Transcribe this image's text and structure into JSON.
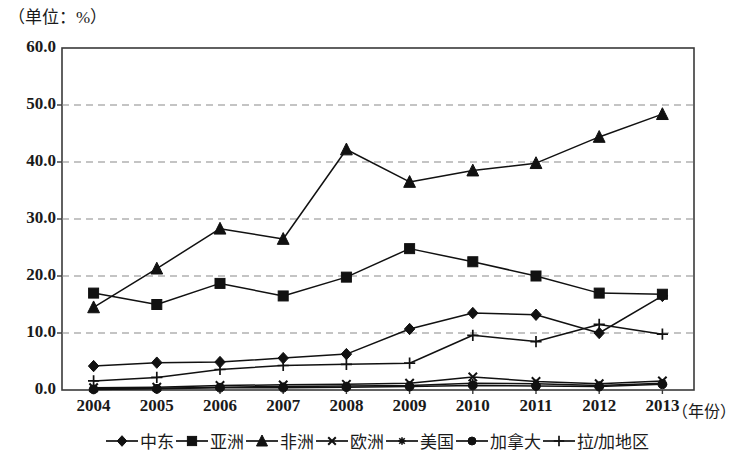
{
  "chart_data": {
    "type": "line",
    "title": "（单位：%）",
    "xlabel": "（年份）",
    "ylabel": "",
    "categories": [
      "2004",
      "2005",
      "2006",
      "2007",
      "2008",
      "2009",
      "2010",
      "2011",
      "2012",
      "2013"
    ],
    "ylim": [
      0,
      60
    ],
    "yticks": [
      "0.0",
      "10.0",
      "20.0",
      "30.0",
      "40.0",
      "50.0",
      "60.0"
    ],
    "grid": true,
    "legend_position": "bottom",
    "series": [
      {
        "name": "中东",
        "marker": "diamond",
        "values": [
          4.2,
          4.8,
          4.9,
          5.6,
          6.3,
          10.7,
          13.5,
          13.2,
          10.0,
          16.5
        ]
      },
      {
        "name": "亚洲",
        "marker": "square",
        "values": [
          17.0,
          15.0,
          18.7,
          16.5,
          19.8,
          24.8,
          22.5,
          20.0,
          17.0,
          16.8
        ]
      },
      {
        "name": "非洲",
        "marker": "triangle",
        "values": [
          14.5,
          21.3,
          28.3,
          26.5,
          42.2,
          36.5,
          38.5,
          39.8,
          44.4,
          48.4
        ]
      },
      {
        "name": "欧洲",
        "marker": "x",
        "values": [
          0.4,
          0.5,
          0.8,
          0.9,
          1.0,
          1.2,
          2.3,
          1.5,
          1.1,
          1.6
        ]
      },
      {
        "name": "美国",
        "marker": "star",
        "values": [
          0.2,
          0.3,
          0.5,
          0.6,
          0.7,
          0.8,
          1.2,
          1.1,
          0.8,
          1.2
        ]
      },
      {
        "name": "加拿大",
        "marker": "circle",
        "values": [
          0.1,
          0.2,
          0.4,
          0.4,
          0.5,
          0.6,
          0.8,
          0.7,
          0.6,
          1.0
        ]
      },
      {
        "name": "拉/加地区",
        "marker": "plus",
        "values": [
          1.6,
          2.2,
          3.6,
          4.3,
          4.5,
          4.7,
          9.6,
          8.5,
          11.5,
          9.8
        ]
      }
    ]
  }
}
